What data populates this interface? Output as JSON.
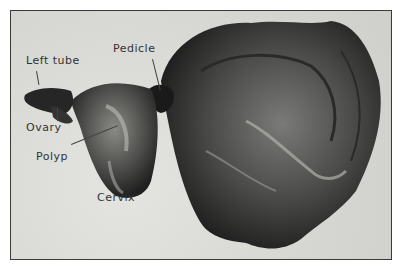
{
  "figure": {
    "labels": {
      "left_tube": "Left tube",
      "pedicle": "Pedicle",
      "ovary": "Ovary",
      "polyp": "Polyp",
      "cervix": "Cervix"
    },
    "colors": {
      "background": "#dcdcd8",
      "specimen_dark": "#1e1e1e",
      "specimen_mid": "#5a5a5a",
      "border": "#3a3a3a"
    }
  }
}
